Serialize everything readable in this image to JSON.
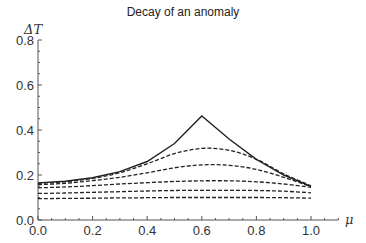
{
  "chart_data": {
    "type": "line",
    "title": "Decay of an anomaly",
    "xlabel": "μ",
    "ylabel": "ΔT",
    "xlim": [
      0.0,
      1.1
    ],
    "ylim": [
      0.0,
      0.8
    ],
    "xticks": [
      "0.0",
      "0.2",
      "0.4",
      "0.6",
      "0.8",
      "1.0"
    ],
    "yticks": [
      "0.0",
      "0.2",
      "0.4",
      "0.6",
      "0.8"
    ],
    "grid": false,
    "legend": null,
    "x": [
      0.0,
      0.1,
      0.2,
      0.3,
      0.4,
      0.5,
      0.6,
      0.7,
      0.8,
      0.9,
      1.0
    ],
    "series": [
      {
        "name": "initial",
        "style": "solid",
        "values": [
          0.165,
          0.172,
          0.188,
          0.215,
          0.26,
          0.34,
          0.462,
          0.36,
          0.27,
          0.2,
          0.15
        ]
      },
      {
        "name": "t1",
        "style": "dashed",
        "values": [
          0.163,
          0.17,
          0.185,
          0.21,
          0.25,
          0.295,
          0.318,
          0.31,
          0.27,
          0.205,
          0.152
        ]
      },
      {
        "name": "t2",
        "style": "dashed",
        "values": [
          0.157,
          0.163,
          0.175,
          0.19,
          0.21,
          0.232,
          0.245,
          0.243,
          0.225,
          0.19,
          0.148
        ]
      },
      {
        "name": "t3",
        "style": "dashed",
        "values": [
          0.143,
          0.147,
          0.153,
          0.16,
          0.166,
          0.171,
          0.174,
          0.174,
          0.17,
          0.16,
          0.145
        ]
      },
      {
        "name": "t4",
        "style": "dashed",
        "values": [
          0.118,
          0.12,
          0.123,
          0.126,
          0.129,
          0.131,
          0.132,
          0.132,
          0.131,
          0.128,
          0.121
        ]
      },
      {
        "name": "t5",
        "style": "dashed",
        "values": [
          0.095,
          0.096,
          0.097,
          0.098,
          0.099,
          0.1,
          0.1,
          0.1,
          0.1,
          0.099,
          0.097
        ]
      }
    ]
  }
}
